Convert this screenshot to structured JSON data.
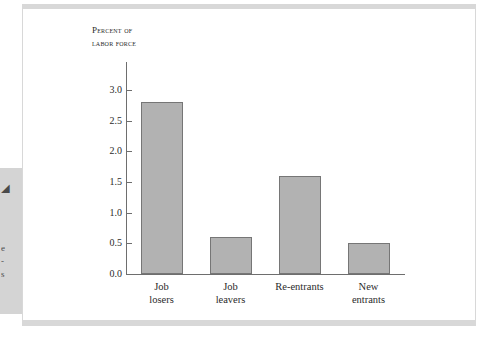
{
  "page": {
    "margin_fragments": [
      "◢",
      "e",
      "-",
      "s"
    ]
  },
  "chart_data": {
    "type": "bar",
    "title": "",
    "axis_title": "Percent of\nlabor force",
    "categories": [
      "Job\nlosers",
      "Job\nleavers",
      "Re-entrants",
      "New\nentrants"
    ],
    "values": [
      2.8,
      0.6,
      1.6,
      0.5
    ],
    "xlabel": "",
    "ylabel": "Percent of labor force",
    "ylim": [
      0.0,
      3.0
    ],
    "yticks": [
      "0.0",
      "0.5",
      "1.0",
      "1.5",
      "2.0",
      "2.5",
      "3.0"
    ],
    "ytick_values": [
      0.0,
      0.5,
      1.0,
      1.5,
      2.0,
      2.5,
      3.0
    ],
    "grid": false,
    "legend": "none",
    "bar_fill_color": "#b2b2b2",
    "bar_border_color": "#767676",
    "axis_color": "#6e6e6e",
    "text_color": "#2b2b2b",
    "frame_color": "#d8d8d8",
    "background_color": "#ffffff"
  }
}
